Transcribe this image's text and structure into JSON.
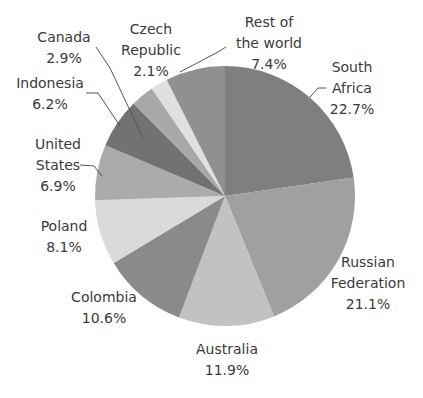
{
  "chart_data": {
    "type": "pie",
    "title": "",
    "start_angle_deg": 0,
    "direction": "clockwise",
    "center": [
      225,
      196
    ],
    "radius": 130,
    "slices": [
      {
        "name": "South Africa",
        "label_lines": [
          "South",
          "Africa"
        ],
        "value": 22.7,
        "pct": "22.7%",
        "color": "#7f7f7f"
      },
      {
        "name": "Russian Federation",
        "label_lines": [
          "Russian",
          "Federation"
        ],
        "value": 21.1,
        "pct": "21.1%",
        "color": "#a0a0a0"
      },
      {
        "name": "Australia",
        "label_lines": [
          "Australia"
        ],
        "value": 11.9,
        "pct": "11.9%",
        "color": "#c2c2c2"
      },
      {
        "name": "Colombia",
        "label_lines": [
          "Colombia"
        ],
        "value": 10.6,
        "pct": "10.6%",
        "color": "#8a8a8a"
      },
      {
        "name": "Poland",
        "label_lines": [
          "Poland"
        ],
        "value": 8.1,
        "pct": "8.1%",
        "color": "#dadada"
      },
      {
        "name": "United States",
        "label_lines": [
          "United",
          "States"
        ],
        "value": 6.9,
        "pct": "6.9%",
        "color": "#ababab"
      },
      {
        "name": "Indonesia",
        "label_lines": [
          "Indonesia"
        ],
        "value": 6.2,
        "pct": "6.2%",
        "color": "#727272"
      },
      {
        "name": "Canada",
        "label_lines": [
          "Canada"
        ],
        "value": 2.9,
        "pct": "2.9%",
        "color": "#a8a8a8"
      },
      {
        "name": "Czech Republic",
        "label_lines": [
          "Czech",
          "Republic"
        ],
        "value": 2.1,
        "pct": "2.1%",
        "color": "#e0e0e0"
      },
      {
        "name": "Rest of the world",
        "label_lines": [
          "Rest of",
          "the world"
        ],
        "value": 7.4,
        "pct": "7.4%",
        "color": "#909090"
      }
    ]
  },
  "labels": {
    "south_africa": {
      "l1": "South",
      "l2": "Africa",
      "pct": "22.7%"
    },
    "russian_federation": {
      "l1": "Russian",
      "l2": "Federation",
      "pct": "21.1%"
    },
    "australia": {
      "l1": "Australia",
      "pct": "11.9%"
    },
    "colombia": {
      "l1": "Colombia",
      "pct": "10.6%"
    },
    "poland": {
      "l1": "Poland",
      "pct": "8.1%"
    },
    "united_states": {
      "l1": "United",
      "l2": "States",
      "pct": "6.9%"
    },
    "indonesia": {
      "l1": "Indonesia",
      "pct": "6.2%"
    },
    "canada": {
      "l1": "Canada",
      "pct": "2.9%"
    },
    "czech_republic": {
      "l1": "Czech",
      "l2": "Republic",
      "pct": "2.1%"
    },
    "rest_of_world": {
      "l1": "Rest of",
      "l2": "the world",
      "pct": "7.4%"
    }
  }
}
